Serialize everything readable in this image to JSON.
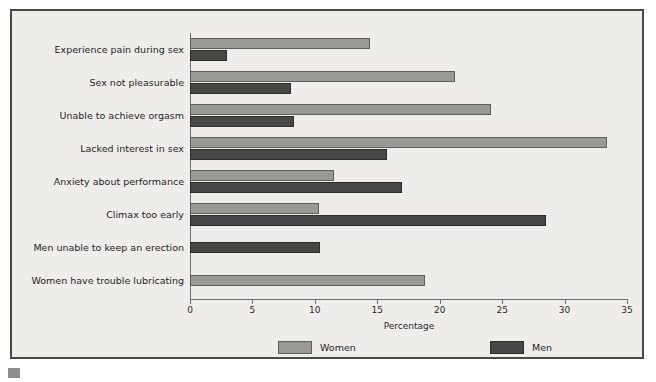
{
  "chart_data": {
    "type": "bar",
    "orientation": "horizontal",
    "title": "",
    "xlabel": "Percentage",
    "ylabel": "",
    "xlim": [
      0,
      35
    ],
    "xticks": [
      0,
      5,
      10,
      15,
      20,
      25,
      30,
      35
    ],
    "grid": false,
    "legend_position": "bottom",
    "categories": [
      "Experience pain during sex",
      "Sex not pleasurable",
      "Unable to achieve orgasm",
      "Lacked interest in sex",
      "Anxiety about performance",
      "Climax too early",
      "Men unable to keep an erection",
      "Women have trouble lubricating"
    ],
    "series": [
      {
        "name": "Women",
        "color": "#9a9a95",
        "values": [
          14.4,
          21.2,
          24.1,
          33.4,
          11.5,
          10.3,
          null,
          18.8
        ]
      },
      {
        "name": "Men",
        "color": "#474747",
        "values": [
          3.0,
          8.1,
          8.3,
          15.8,
          17.0,
          28.5,
          10.4,
          null
        ]
      }
    ]
  },
  "axis": {
    "x_title": "Percentage",
    "tick_labels": [
      "0",
      "5",
      "10",
      "15",
      "20",
      "25",
      "30",
      "35"
    ]
  },
  "legend": {
    "items": [
      {
        "label": "Women",
        "color": "#9a9a95"
      },
      {
        "label": "Men",
        "color": "#474747"
      }
    ]
  },
  "colors": {
    "women": "#9a9a95",
    "men": "#474747",
    "panel_background": "#eeedea",
    "frame_border": "#4a4a4a",
    "axis": "#6f6f6f",
    "text": "#1e1e1e"
  }
}
